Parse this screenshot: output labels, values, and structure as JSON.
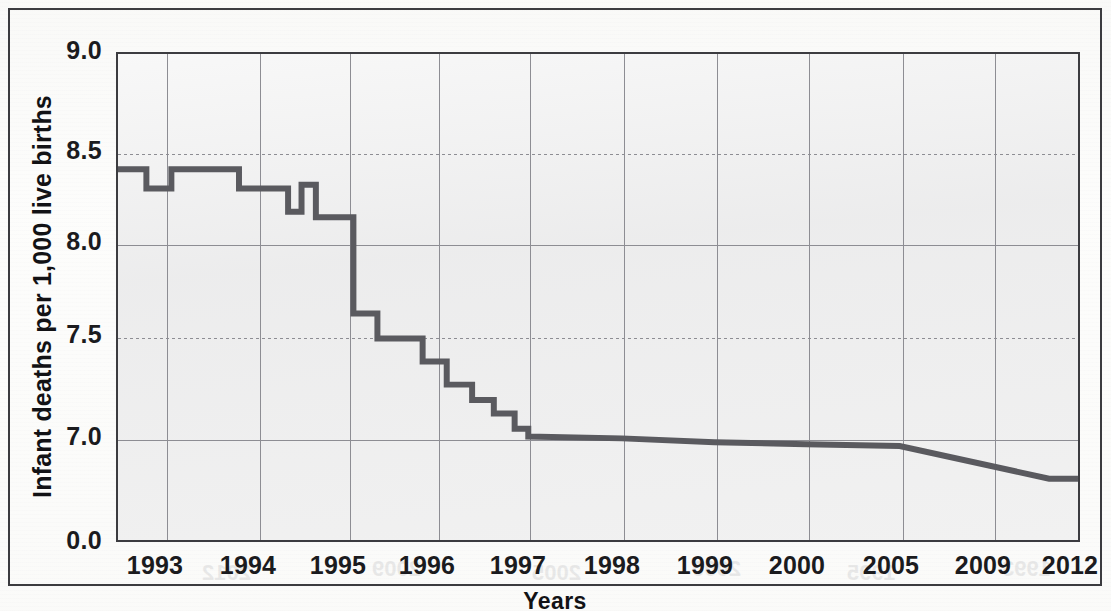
{
  "figure": {
    "background_color": "#fdfdfc",
    "plot_background_color": "#efefef",
    "border_color": "#3b3b3f",
    "line_color": "#5a5a5f",
    "grid_color": "#8d8d93"
  },
  "axes": {
    "x_title": "Years",
    "y_title": "Infant deaths per 1,000 live births",
    "y_ticks": [
      "0.0",
      "7.0",
      "7.5",
      "8.0",
      "8.5",
      "9.0"
    ],
    "x_ticks": [
      "1993",
      "1994",
      "1995",
      "1996",
      "1997",
      "1998",
      "1999",
      "2000",
      "2005",
      "2009",
      "2012"
    ]
  },
  "ghost_text": [
    {
      "text": "1993",
      "left": 60,
      "top": 556
    },
    {
      "text": "1995",
      "left": 215,
      "top": 560
    },
    {
      "text": "2000",
      "left": 370,
      "top": 556
    },
    {
      "text": "2005",
      "left": 530,
      "top": 560
    },
    {
      "text": "2009",
      "left": 690,
      "top": 556
    },
    {
      "text": "2012",
      "left": 860,
      "top": 560
    },
    {
      "text": "1990",
      "left": 200,
      "top": 95
    },
    {
      "text": "1985",
      "left": 430,
      "top": 110
    },
    {
      "text": "Live births",
      "left": 700,
      "top": 60
    },
    {
      "text": "Infant deaths",
      "left": 720,
      "top": 90
    }
  ],
  "chart_data": {
    "type": "line",
    "title": "",
    "xlabel": "Years",
    "ylabel": "Infant deaths per 1,000 live births",
    "ylim": [
      6.6,
      9.0
    ],
    "y_axis_break": true,
    "y_axis_break_note": "Axis shows 0.0 then resumes at 7.0",
    "grid": true,
    "legend": "none",
    "xlim_labels": [
      "1993",
      "2012"
    ],
    "x_tick_labels": [
      "1993",
      "1994",
      "1995",
      "1996",
      "1997",
      "1998",
      "1999",
      "2000",
      "2005",
      "2009",
      "2012"
    ],
    "y_tick_labels": [
      "0.0",
      "7.0",
      "7.5",
      "8.0",
      "8.5",
      "9.0"
    ],
    "series": [
      {
        "name": "Infant mortality rate",
        "color": "#5a5a5f",
        "x": [
          1992.45,
          1992.78,
          1992.78,
          1993.05,
          1993.05,
          1993.3,
          1993.3,
          1993.78,
          1993.78,
          1994.02,
          1994.02,
          1994.32,
          1994.32,
          1994.47,
          1994.47,
          1994.63,
          1994.63,
          1994.78,
          1994.78,
          1995.05,
          1995.05,
          1995.32,
          1995.32,
          1995.58,
          1995.58,
          1995.83,
          1995.83,
          1996.1,
          1996.1,
          1996.38,
          1996.38,
          1996.62,
          1996.62,
          1996.85,
          1996.85,
          1997.0,
          1997.0,
          1998.0,
          1999.0,
          2000.0,
          2005.0,
          2011.0,
          2012.0
        ],
        "y": [
          8.4,
          8.4,
          8.3,
          8.3,
          8.4,
          8.4,
          8.4,
          8.4,
          8.3,
          8.3,
          8.3,
          8.3,
          8.18,
          8.18,
          8.32,
          8.32,
          8.15,
          8.15,
          8.15,
          8.15,
          7.65,
          7.65,
          7.52,
          7.52,
          7.52,
          7.52,
          7.4,
          7.4,
          7.28,
          7.28,
          7.2,
          7.2,
          7.13,
          7.13,
          7.05,
          7.05,
          7.01,
          7.0,
          6.98,
          6.97,
          6.96,
          6.79,
          6.79
        ],
        "annotations": [
          "Stepwise decline 1993-1997 from 8.4 to 7.0",
          "Near-flat plateau 1997-2005 around 7.0",
          "Decline 2005-2011 from 6.96 to 6.79",
          "Flat 2011-2012 at 6.79"
        ]
      }
    ]
  }
}
